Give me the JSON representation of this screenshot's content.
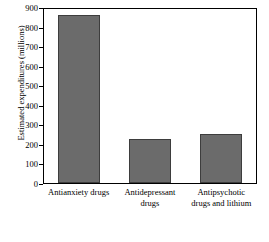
{
  "chart_data": {
    "type": "bar",
    "title": "",
    "xlabel": "",
    "ylabel": "Estimated expenditures (millions)",
    "categories": [
      "Antianxiety drugs",
      "Antidepressant drugs",
      "Antipsychotic drugs and lithium"
    ],
    "values": [
      860,
      225,
      250
    ],
    "ylim": [
      0,
      900
    ],
    "yticks": [
      0,
      100,
      200,
      300,
      400,
      500,
      600,
      700,
      800,
      900
    ],
    "ytick_labels": [
      "0",
      "100",
      "200",
      "300",
      "400",
      "500",
      "600",
      "700",
      "800",
      "900"
    ],
    "grid": false,
    "legend": null,
    "bar_color": "#6b6b6b",
    "axis_color": "#000000",
    "background": "#ffffff"
  }
}
